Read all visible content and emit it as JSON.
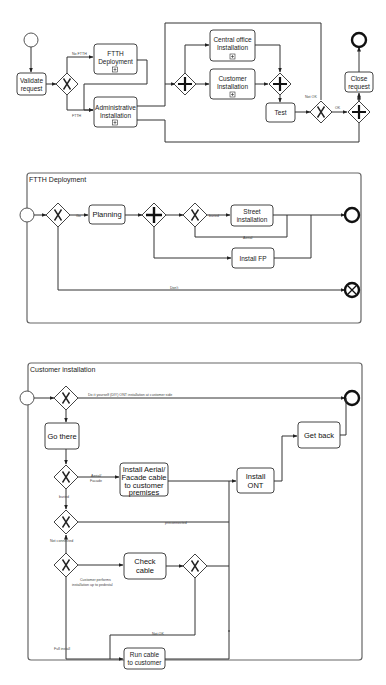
{
  "header": {
    "text": ""
  },
  "diagram1": {
    "tasks": {
      "validate": [
        "Validate",
        "request"
      ],
      "ftth": [
        "FTTH",
        "Deployment"
      ],
      "admin": [
        "Administrative",
        "Installation"
      ],
      "central": [
        "Central office",
        "Installation"
      ],
      "customer": [
        "Customer",
        "Installation"
      ],
      "test": [
        "Test"
      ],
      "close": [
        "Close",
        "request"
      ]
    },
    "labels": {
      "no_ftth": "No FTTH",
      "ftth": "FTTH",
      "not_ok": "Not OK",
      "ok": "OK"
    }
  },
  "diagram2": {
    "title": "FTTH Deployment",
    "tasks": {
      "planning": [
        "Planning"
      ],
      "street": [
        "Street",
        "installation"
      ],
      "install_fp": [
        "Install FP"
      ]
    },
    "labels": {
      "go": "Go",
      "buried": "buried",
      "aerial": "Aerial",
      "don_t": "Don't"
    }
  },
  "diagram3": {
    "title": "Customer installation",
    "tasks": {
      "go_there": [
        "Go there"
      ],
      "get_back": [
        "Get back"
      ],
      "install_aerial": [
        "Install Aerial/",
        "Facade cable",
        "to customer",
        "premises"
      ],
      "install_ont": [
        "Install",
        "ONT"
      ],
      "check_cable": [
        "Check",
        "cable"
      ],
      "run_cable": [
        "Run cable",
        "to customer"
      ]
    },
    "labels": {
      "diy": "Do it yourself (DIY) ONT installation at customer side",
      "aerial_facade": [
        "Aerial/",
        "Facade"
      ],
      "buried": "buried",
      "preconnected": "preconnected",
      "not_connected": "Not connected",
      "customer_performs": [
        "Customer performs",
        "installation up to pedestal"
      ],
      "not_ok": "Not OK",
      "full_install": "Full install"
    }
  }
}
